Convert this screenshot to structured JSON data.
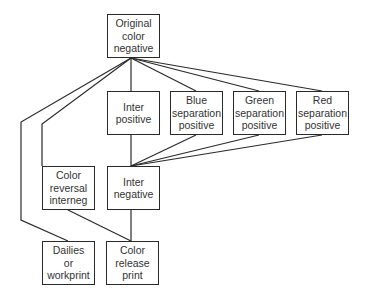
{
  "diagram": {
    "nodes": [
      {
        "id": "original",
        "label": "Original\ncolor\nnegative",
        "x": 107,
        "y": 14,
        "w": 53,
        "h": 44
      },
      {
        "id": "interpos",
        "label": "Inter\npositive",
        "x": 107,
        "y": 91,
        "w": 53,
        "h": 44
      },
      {
        "id": "blue",
        "label": "Blue\nseparation\npositive",
        "x": 170,
        "y": 91,
        "w": 53,
        "h": 44
      },
      {
        "id": "green",
        "label": "Green\nseparation\npositive",
        "x": 233,
        "y": 91,
        "w": 53,
        "h": 44
      },
      {
        "id": "red",
        "label": "Red\nseparation\npositive",
        "x": 296,
        "y": 91,
        "w": 53,
        "h": 44
      },
      {
        "id": "colorrev",
        "label": "Color\nreversal\ninterneg",
        "x": 42,
        "y": 166,
        "w": 53,
        "h": 44
      },
      {
        "id": "interneg",
        "label": "Inter\nnegative",
        "x": 107,
        "y": 166,
        "w": 53,
        "h": 44
      },
      {
        "id": "dailies",
        "label": "Dailies\nor\nworkprint",
        "x": 42,
        "y": 241,
        "w": 53,
        "h": 44
      },
      {
        "id": "release",
        "label": "Color\nrelease\nprint",
        "x": 106,
        "y": 241,
        "w": 53,
        "h": 44
      }
    ],
    "edges": [
      {
        "from": "original",
        "to": "interpos"
      },
      {
        "from": "original",
        "to": "blue"
      },
      {
        "from": "original",
        "to": "green"
      },
      {
        "from": "original",
        "to": "red"
      },
      {
        "from": "original",
        "to": "colorrev"
      },
      {
        "from": "original",
        "to": "dailies"
      },
      {
        "from": "interpos",
        "to": "interneg"
      },
      {
        "from": "blue",
        "to": "interneg"
      },
      {
        "from": "green",
        "to": "interneg"
      },
      {
        "from": "red",
        "to": "interneg"
      },
      {
        "from": "interneg",
        "to": "release"
      },
      {
        "from": "colorrev",
        "to": "release"
      }
    ]
  }
}
